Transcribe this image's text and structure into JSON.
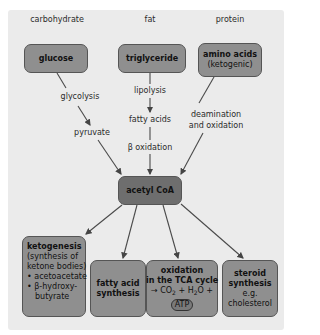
{
  "sources": {
    "carbohydrate": {
      "category": "carbohydrate",
      "box": "glucose"
    },
    "fat": {
      "category": "fat",
      "box": "triglyceride"
    },
    "protein": {
      "category": "protein",
      "box_title": "amino acids",
      "box_sub": "(ketogenic)"
    }
  },
  "pathway_labels": {
    "glycolysis": "glycolysis",
    "pyruvate": "pyruvate",
    "lipolysis": "lipolysis",
    "fatty_acids": "fatty acids",
    "beta_oxidation": "β oxidation",
    "deamination_1": "deamination",
    "deamination_2": "and oxidation"
  },
  "center": {
    "label": "acetyl CoA"
  },
  "outputs": {
    "ketogenesis": {
      "title": "ketogenesis",
      "sub1": "(synthesis of",
      "sub2": "ketone bodies)",
      "bullets": [
        "• acetoacetate",
        "• β-hydroxy-",
        "  butyrate"
      ]
    },
    "fatty_acid": {
      "line1": "fatty acid",
      "line2": "synthesis"
    },
    "oxidation": {
      "line1": "oxidation",
      "line2": "in the TCA cycle",
      "eq_pre": "→ CO",
      "eq_sub1": "2",
      "eq_mid": " + H",
      "eq_sub2": "2",
      "eq_post": "O +",
      "atp": "ATP"
    },
    "steroid": {
      "line1": "steroid",
      "line2": "synthesis",
      "line3": "e.g.",
      "line4": "cholesterol"
    }
  },
  "colors": {
    "panel": "#ebebeb",
    "box": "#8f8f8f",
    "center_box": "#6e6e6e",
    "arrow": "#444444"
  }
}
